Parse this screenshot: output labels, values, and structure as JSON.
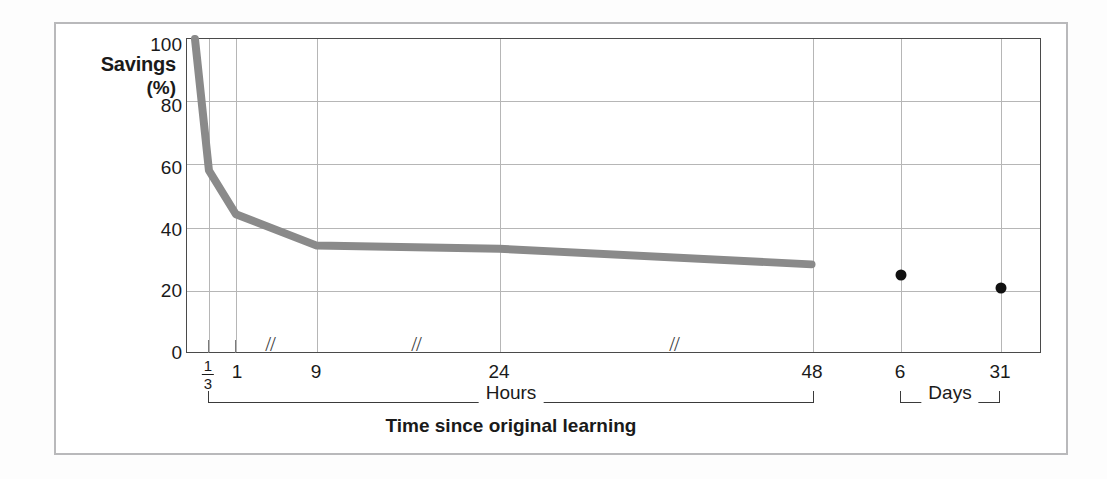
{
  "chart_data": {
    "type": "line",
    "title": "",
    "xlabel": "Time since original learning",
    "ylabel": "Savings",
    "ylabel_unit": "(%)",
    "ylim": [
      0,
      100
    ],
    "yticks": [
      0,
      20,
      40,
      60,
      80,
      100
    ],
    "ytick_labels": [
      "0",
      "20",
      "40",
      "60",
      "80",
      "100"
    ],
    "grid": true,
    "axis_breaks": [
      "between 1 and 9 hours",
      "between 9 and 24 hours",
      "between 24 and 48 hours"
    ],
    "x_tick_labels": [
      "1/3",
      "1",
      "9",
      "24",
      "48",
      "6",
      "31"
    ],
    "x_group_brackets": [
      {
        "label": "Hours",
        "from": "1/3",
        "to": "48"
      },
      {
        "label": "Days",
        "from": "6",
        "to": "31"
      }
    ],
    "series": [
      {
        "name": "Savings curve (hours)",
        "style": "line",
        "color": "#8a8a8a",
        "points": [
          {
            "x_label": "0",
            "hours": 0,
            "value": 100
          },
          {
            "x_label": "1/3",
            "hours": 0.333,
            "value": 58
          },
          {
            "x_label": "1",
            "hours": 1,
            "value": 44
          },
          {
            "x_label": "9",
            "hours": 9,
            "value": 34
          },
          {
            "x_label": "24",
            "hours": 24,
            "value": 33
          },
          {
            "x_label": "48",
            "hours": 48,
            "value": 28
          }
        ]
      },
      {
        "name": "Savings points (days)",
        "style": "scatter",
        "color": "#111111",
        "points": [
          {
            "x_label": "6",
            "days": 6,
            "value": 25
          },
          {
            "x_label": "31",
            "days": 31,
            "value": 21
          }
        ]
      }
    ]
  },
  "figure": {
    "y_axis_title": "Savings",
    "y_axis_unit": "(%)",
    "x_axis_caption": "Time since original learning",
    "hours_bracket_label": "Hours",
    "days_bracket_label": "Days",
    "break_glyph": "//",
    "ytick_labels": {
      "t0": "0",
      "t20": "20",
      "t40": "40",
      "t60": "60",
      "t80": "80",
      "t100": "100"
    },
    "xtick_labels": {
      "third_num": "1",
      "third_den": "3",
      "one": "1",
      "nine": "9",
      "twentyfour": "24",
      "fortyeight": "48",
      "six": "6",
      "thirtyone": "31"
    },
    "colors": {
      "curve": "#8a8a8a",
      "dot": "#111111",
      "grid": "#b6b6b6",
      "frame": "#4a4a4a",
      "page_border": "#b9b9bb"
    }
  }
}
